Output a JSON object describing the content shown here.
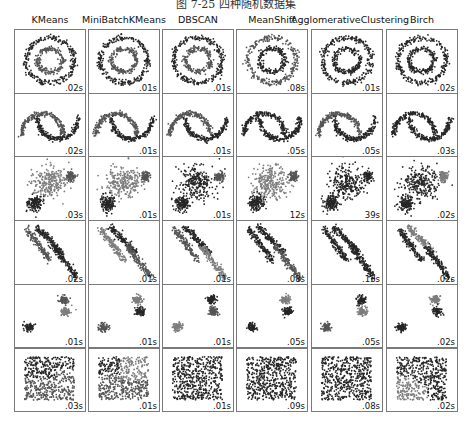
{
  "figure": {
    "caption": "图 7-25  四种随机数据集",
    "colors": {
      "dark": "#262626",
      "mid": "#555555",
      "light": "#7d7d7d",
      "border": "#7a7a7a"
    }
  },
  "columns": [
    {
      "title": "KMeans"
    },
    {
      "title": "MiniBatchKMeans"
    },
    {
      "title": "DBSCAN"
    },
    {
      "title": "MeanShift"
    },
    {
      "title": "AgglomerativeClustering"
    },
    {
      "title": "Birch"
    }
  ],
  "rows": [
    {
      "dataset": "noisy_circles",
      "times": [
        ".02s",
        ".01s",
        ".01s",
        ".08s",
        ".01s",
        ".02s"
      ]
    },
    {
      "dataset": "noisy_moons",
      "times": [
        ".02s",
        ".01s",
        ".01s",
        ".05s",
        ".05s",
        ".03s"
      ]
    },
    {
      "dataset": "varied",
      "times": [
        ".03s",
        ".01s",
        ".01s",
        "12s",
        "39s",
        ".02s"
      ]
    },
    {
      "dataset": "aniso",
      "times": [
        ".02s",
        ".01s",
        ".01s",
        ".08s",
        ".13s",
        ".02s"
      ]
    },
    {
      "dataset": "blobs",
      "times": [
        ".01s",
        ".01s",
        ".01s",
        ".05s",
        ".05s",
        ".02s"
      ]
    },
    {
      "dataset": "no_structure",
      "times": [
        ".03s",
        ".01s",
        ".01s",
        ".09s",
        ".08s",
        ".02s"
      ]
    }
  ],
  "chart_data": {
    "type": "scatter",
    "columns": [
      "KMeans",
      "MiniBatchKMeans",
      "DBSCAN",
      "MeanShift",
      "AgglomerativeClustering",
      "Birch"
    ],
    "rows": [
      "noisy_circles",
      "noisy_moons",
      "varied",
      "aniso",
      "blobs",
      "no_structure"
    ],
    "timings": [
      [
        ".02s",
        ".01s",
        ".01s",
        ".08s",
        ".01s",
        ".02s"
      ],
      [
        ".02s",
        ".01s",
        ".01s",
        ".05s",
        ".05s",
        ".03s"
      ],
      [
        ".03s",
        ".01s",
        ".01s",
        "12s",
        "39s",
        ".02s"
      ],
      [
        ".02s",
        ".01s",
        ".01s",
        ".08s",
        ".13s",
        ".02s"
      ],
      [
        ".01s",
        ".01s",
        ".01s",
        ".05s",
        ".05s",
        ".02s"
      ],
      [
        ".03s",
        ".01s",
        ".01s",
        ".09s",
        ".08s",
        ".02s"
      ]
    ],
    "grid": false,
    "axes_ticks": false
  }
}
